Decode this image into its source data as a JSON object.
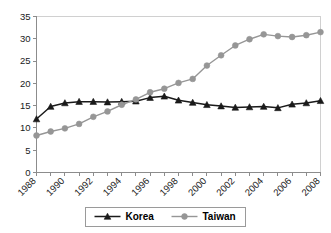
{
  "chart_data": {
    "type": "line",
    "title": "",
    "subtitle": "",
    "xlabel": "",
    "ylabel": "",
    "xlim": [
      1988,
      2008
    ],
    "ylim": [
      0,
      35
    ],
    "grid": false,
    "legend_position": "bottom",
    "x": [
      1988,
      1989,
      1990,
      1991,
      1992,
      1993,
      1994,
      1995,
      1996,
      1997,
      1998,
      1999,
      2000,
      2001,
      2002,
      2003,
      2004,
      2005,
      2006,
      2007,
      2008
    ],
    "xtick_labels": [
      "1988",
      "1990",
      "1992",
      "1994",
      "1996",
      "1998",
      "2000",
      "2002",
      "2004",
      "2006",
      "2008"
    ],
    "xtick_values": [
      1988,
      1990,
      1992,
      1994,
      1996,
      1998,
      2000,
      2002,
      2004,
      2006,
      2008
    ],
    "ytick_labels": [
      "0",
      "5",
      "10",
      "15",
      "20",
      "25",
      "30",
      "35"
    ],
    "ytick_values": [
      0,
      5,
      10,
      15,
      20,
      25,
      30,
      35
    ],
    "series": [
      {
        "name": "Korea",
        "color": "#1a1a1a",
        "marker": "triangle",
        "values": [
          12.0,
          14.8,
          15.6,
          15.9,
          15.9,
          15.8,
          15.9,
          16.0,
          16.8,
          17.1,
          16.2,
          15.7,
          15.2,
          14.9,
          14.6,
          14.7,
          14.8,
          14.5,
          15.3,
          15.6,
          16.1
        ]
      },
      {
        "name": "Taiwan",
        "color": "#969696",
        "marker": "circle",
        "values": [
          8.3,
          9.2,
          9.9,
          10.9,
          12.5,
          13.7,
          15.2,
          16.4,
          18.0,
          18.8,
          20.1,
          21.0,
          24.0,
          26.3,
          28.5,
          29.9,
          31.0,
          30.6,
          30.4,
          30.8,
          31.5
        ]
      }
    ]
  },
  "legend": {
    "entries": [
      {
        "label": "Korea"
      },
      {
        "label": "Taiwan"
      }
    ]
  }
}
